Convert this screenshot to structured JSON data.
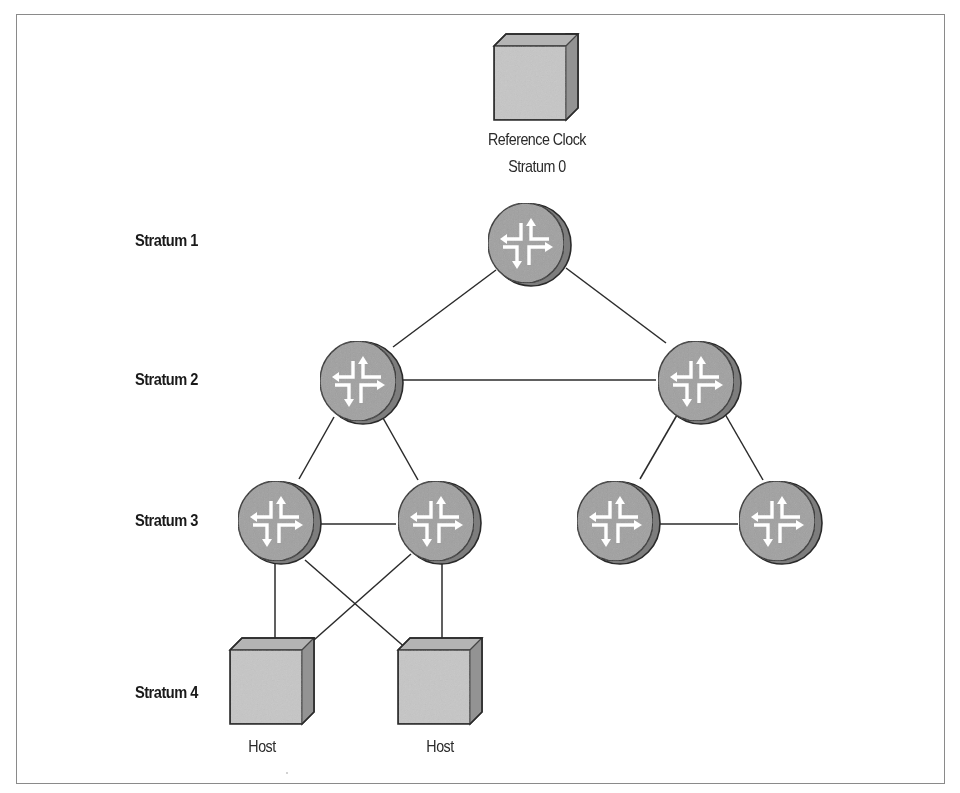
{
  "diagram": {
    "colors": {
      "frame": "#8a8a8a",
      "line": "#2b2b2b",
      "router_fill": "#9c9c9c",
      "router_side": "#7a7a7a",
      "router_arrows": "#ffffff",
      "cube_front": "#c4c4c4",
      "cube_top": "#b2b2b2",
      "cube_side": "#9a9a9a",
      "label_text": "#1a1a1a"
    },
    "stratum_labels": [
      {
        "id": "s1",
        "text": "Stratum 1",
        "x": 135,
        "y": 231
      },
      {
        "id": "s2",
        "text": "Stratum 2",
        "x": 135,
        "y": 370
      },
      {
        "id": "s3",
        "text": "Stratum 3",
        "x": 135,
        "y": 511
      },
      {
        "id": "s4",
        "text": "Stratum 4",
        "x": 135,
        "y": 683
      }
    ],
    "nodes": [
      {
        "id": "refclock",
        "type": "cube",
        "x": 494,
        "y": 34,
        "w": 84,
        "h": 86,
        "label_lines": [
          "Reference Clock",
          "Stratum 0"
        ]
      },
      {
        "id": "s1-router",
        "type": "router",
        "cx": 527,
        "cy": 243,
        "r": 41,
        "stratum": 1
      },
      {
        "id": "s2-left",
        "type": "router",
        "cx": 357,
        "cy": 381,
        "r": 41,
        "stratum": 2
      },
      {
        "id": "s2-right",
        "type": "router",
        "cx": 697,
        "cy": 381,
        "r": 41,
        "stratum": 2
      },
      {
        "id": "s3-a",
        "type": "router",
        "cx": 275,
        "cy": 521,
        "r": 41,
        "stratum": 3
      },
      {
        "id": "s3-b",
        "type": "router",
        "cx": 437,
        "cy": 521,
        "r": 41,
        "stratum": 3
      },
      {
        "id": "s3-c",
        "type": "router",
        "cx": 615,
        "cy": 521,
        "r": 41,
        "stratum": 3
      },
      {
        "id": "s3-d",
        "type": "router",
        "cx": 779,
        "cy": 521,
        "r": 41,
        "stratum": 3
      },
      {
        "id": "host-left",
        "type": "cube",
        "x": 230,
        "y": 638,
        "w": 84,
        "h": 86,
        "label_lines": [
          "Host"
        ]
      },
      {
        "id": "host-right",
        "type": "cube",
        "x": 398,
        "y": 638,
        "w": 84,
        "h": 86,
        "label_lines": [
          "Host"
        ]
      }
    ],
    "links": [
      {
        "from": "s1-router",
        "to": "s2-left"
      },
      {
        "from": "s1-router",
        "to": "s2-right"
      },
      {
        "from": "s2-left",
        "to": "s2-right"
      },
      {
        "from": "s2-left",
        "to": "s3-a"
      },
      {
        "from": "s2-left",
        "to": "s3-b"
      },
      {
        "from": "s2-right",
        "to": "s3-c"
      },
      {
        "from": "s2-right",
        "to": "s3-d"
      },
      {
        "from": "s3-a",
        "to": "s3-b"
      },
      {
        "from": "s3-c",
        "to": "s3-d"
      },
      {
        "from": "s3-a",
        "to": "host-left"
      },
      {
        "from": "s3-a",
        "to": "host-right"
      },
      {
        "from": "s3-b",
        "to": "host-left"
      },
      {
        "from": "s3-b",
        "to": "host-right"
      }
    ],
    "text": {
      "refclock_line1": "Reference Clock",
      "refclock_line2": "Stratum 0",
      "stratum1": "Stratum 1",
      "stratum2": "Stratum 2",
      "stratum3": "Stratum 3",
      "stratum4": "Stratum 4",
      "host_left": "Host",
      "host_right": "Host"
    }
  }
}
